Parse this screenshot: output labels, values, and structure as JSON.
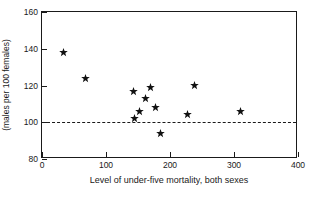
{
  "chart_data": {
    "type": "scatter",
    "title": "",
    "subtitle": "",
    "xlabel": "Level of under-five mortality, both sexes",
    "ylabel": "(males per 100 females)",
    "xlim": [
      0,
      400
    ],
    "ylim": [
      80,
      160
    ],
    "xticks": [
      0,
      100,
      200,
      300,
      400
    ],
    "yticks": [
      80,
      100,
      120,
      140,
      160
    ],
    "xtick_labels": [
      "0",
      "100",
      "200",
      "300",
      "400"
    ],
    "ytick_labels": [
      "80",
      "100",
      "120",
      "140",
      "160"
    ],
    "grid": false,
    "legend": null,
    "marker_style": "star",
    "marker_color": "#111111",
    "reference_lines": [
      {
        "name": "parity-line",
        "axis": "y",
        "value": 100,
        "style": "dashed",
        "color": "#1a1a1a"
      }
    ],
    "series": [
      {
        "name": "sex-ratio",
        "points": [
          {
            "x": 33,
            "y": 138
          },
          {
            "x": 68,
            "y": 124
          },
          {
            "x": 143,
            "y": 117
          },
          {
            "x": 145,
            "y": 102
          },
          {
            "x": 153,
            "y": 106
          },
          {
            "x": 161,
            "y": 113
          },
          {
            "x": 170,
            "y": 119
          },
          {
            "x": 178,
            "y": 108
          },
          {
            "x": 185,
            "y": 94
          },
          {
            "x": 228,
            "y": 104
          },
          {
            "x": 239,
            "y": 120
          },
          {
            "x": 310,
            "y": 106
          }
        ]
      }
    ]
  }
}
